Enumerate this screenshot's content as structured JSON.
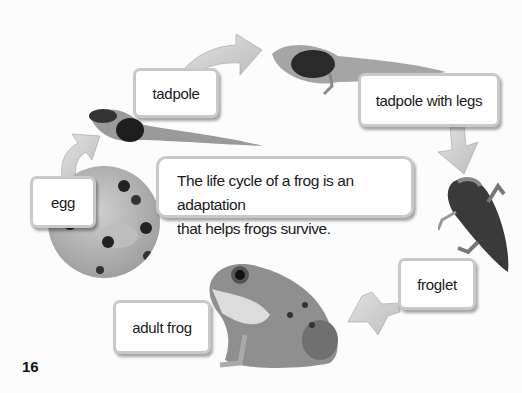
{
  "diagram": {
    "caption": "The life cycle of a frog is an adaptation that helps frogs survive.",
    "caption_line1": "The life cycle of a frog is an adaptation",
    "caption_line2": "that helps frogs survive.",
    "stages": [
      {
        "label": "egg"
      },
      {
        "label": "tadpole"
      },
      {
        "label": "tadpole with legs"
      },
      {
        "label": "froglet"
      },
      {
        "label": "adult frog"
      }
    ],
    "arrow_color": "#c8c8c8"
  },
  "page": {
    "number": "16"
  }
}
